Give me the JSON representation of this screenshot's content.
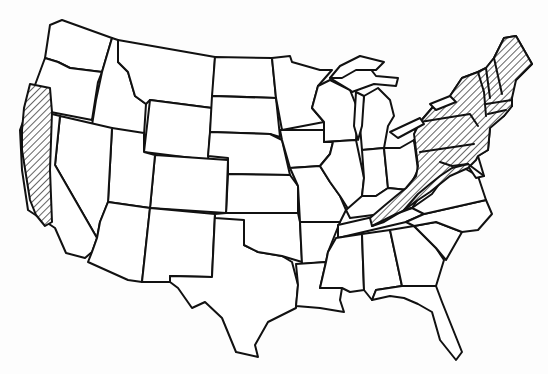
{
  "map": {
    "title": "",
    "subject": "Contiguous United States outline map",
    "style": "black-and-white line drawing with diagonal hatching",
    "colors": {
      "background": "#fdfdfd",
      "outline": "#111111",
      "hatch": "#111111"
    },
    "highlighted_regions": [
      {
        "id": "pacific-coast",
        "label": "Northern and central California coast / southwest Oregon coast",
        "pattern": "diagonal-hatch"
      },
      {
        "id": "northeast-appalachian",
        "label": "New England, New York, Pennsylvania, New Jersey, and the Appalachian belt of West Virginia, Virginia, Maryland, and eastern Kentucky",
        "pattern": "diagonal-hatch"
      }
    ],
    "legend": null,
    "labels": []
  }
}
